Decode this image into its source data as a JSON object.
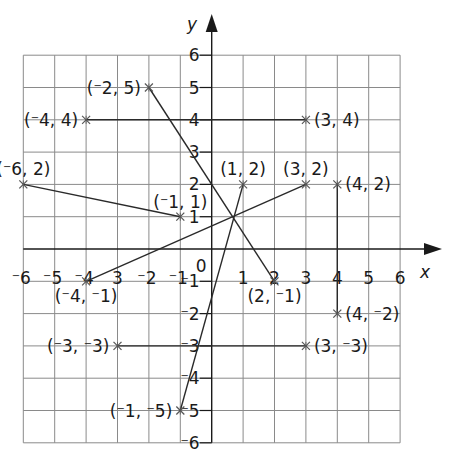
{
  "diagram": {
    "type": "coordinate-grid",
    "axes": {
      "x_label": "x",
      "y_label": "y",
      "x_range": [
        -6,
        6
      ],
      "y_range": [
        -6,
        6
      ],
      "origin_label": "0",
      "x_ticks": [
        {
          "value": -6,
          "sign": "¯",
          "num": "6"
        },
        {
          "value": -5,
          "sign": "¯",
          "num": "5"
        },
        {
          "value": -4,
          "sign": "¯",
          "num": "4"
        },
        {
          "value": -3,
          "sign": "",
          "num": "3"
        },
        {
          "value": -2,
          "sign": "¯",
          "num": "2"
        },
        {
          "value": -1,
          "sign": "¯",
          "num": "1"
        },
        {
          "value": 1,
          "sign": "",
          "num": "1"
        },
        {
          "value": 2,
          "sign": "",
          "num": "2"
        },
        {
          "value": 3,
          "sign": "",
          "num": "3"
        },
        {
          "value": 4,
          "sign": "",
          "num": "4"
        },
        {
          "value": 5,
          "sign": "",
          "num": "5"
        },
        {
          "value": 6,
          "sign": "",
          "num": "6"
        }
      ],
      "y_ticks": [
        {
          "value": 6,
          "sign": "",
          "num": "6"
        },
        {
          "value": 5,
          "sign": "",
          "num": "5"
        },
        {
          "value": 4,
          "sign": "",
          "num": "4"
        },
        {
          "value": 3,
          "sign": "",
          "num": "3"
        },
        {
          "value": 2,
          "sign": "",
          "num": "2"
        },
        {
          "value": 1,
          "sign": "",
          "num": "1"
        },
        {
          "value": -1,
          "sign": "¯",
          "num": "1"
        },
        {
          "value": -2,
          "sign": "¯",
          "num": "2"
        },
        {
          "value": -3,
          "sign": "¯",
          "num": "3"
        },
        {
          "value": -4,
          "sign": "¯",
          "num": "4"
        },
        {
          "value": -5,
          "sign": "¯",
          "num": "5"
        },
        {
          "value": -6,
          "sign": "¯",
          "num": "6"
        }
      ]
    },
    "points": [
      {
        "x": -2,
        "y": 5,
        "label": "(¯2, 5)",
        "label_pos": "left"
      },
      {
        "x": -4,
        "y": 4,
        "label": "(¯4, 4)",
        "label_pos": "left"
      },
      {
        "x": 3,
        "y": 4,
        "label": "(3, 4)",
        "label_pos": "right"
      },
      {
        "x": -6,
        "y": 2,
        "label": "(¯6, 2)",
        "label_pos": "above"
      },
      {
        "x": 1,
        "y": 2,
        "label": "(1, 2)",
        "label_pos": "above"
      },
      {
        "x": 3,
        "y": 2,
        "label": "(3, 2)",
        "label_pos": "above"
      },
      {
        "x": 4,
        "y": 2,
        "label": "(4, 2)",
        "label_pos": "right"
      },
      {
        "x": -1,
        "y": 1,
        "label": "(¯1, 1)",
        "label_pos": "above"
      },
      {
        "x": -4,
        "y": -1,
        "label": "(¯4, ¯1)",
        "label_pos": "below"
      },
      {
        "x": 2,
        "y": -1,
        "label": "(2, ¯1)",
        "label_pos": "below"
      },
      {
        "x": 4,
        "y": -2,
        "label": "(4, ¯2)",
        "label_pos": "right"
      },
      {
        "x": -3,
        "y": -3,
        "label": "(¯3, ¯3)",
        "label_pos": "left"
      },
      {
        "x": 3,
        "y": -3,
        "label": "(3, ¯3)",
        "label_pos": "right"
      },
      {
        "x": -1,
        "y": -5,
        "label": "(¯1, ¯5)",
        "label_pos": "left"
      }
    ],
    "segments": [
      {
        "from": [
          -2,
          5
        ],
        "to": [
          2,
          -1
        ]
      },
      {
        "from": [
          -4,
          4
        ],
        "to": [
          3,
          4
        ]
      },
      {
        "from": [
          -6,
          2
        ],
        "to": [
          -1,
          1
        ]
      },
      {
        "from": [
          1,
          2
        ],
        "to": [
          -1,
          -5
        ]
      },
      {
        "from": [
          3,
          2
        ],
        "to": [
          -4,
          -1
        ]
      },
      {
        "from": [
          4,
          2
        ],
        "to": [
          4,
          -2
        ]
      },
      {
        "from": [
          -3,
          -3
        ],
        "to": [
          3,
          -3
        ]
      }
    ],
    "colors": {
      "grid": "#8a8a8a",
      "axis": "#1a1a1a",
      "segment": "#2a2a2a",
      "point": "#555555",
      "background": "#ffffff"
    }
  }
}
